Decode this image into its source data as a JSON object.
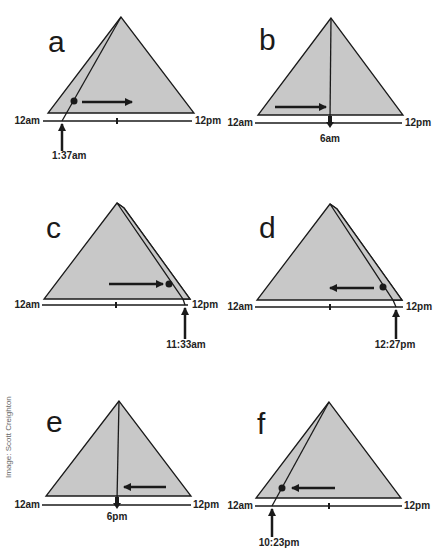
{
  "figure": {
    "credit": "Image: Scott Creighton",
    "colors": {
      "pyramid_fill": "#c8c8c8",
      "line": "#1a1a1a",
      "background": "#ffffff"
    },
    "panels": [
      {
        "letter": "a",
        "start_label": "12am",
        "end_label": "12pm",
        "time_label": "1:37am",
        "arrow_direction": "right"
      },
      {
        "letter": "b",
        "start_label": "12am",
        "end_label": "12pm",
        "time_label": "6am",
        "arrow_direction": "right"
      },
      {
        "letter": "c",
        "start_label": "12am",
        "end_label": "12pm",
        "time_label": "11:33am",
        "arrow_direction": "right"
      },
      {
        "letter": "d",
        "start_label": "12am",
        "end_label": "12pm",
        "time_label": "12:27pm",
        "arrow_direction": "left"
      },
      {
        "letter": "e",
        "start_label": "12am",
        "end_label": "12pm",
        "time_label": "6pm",
        "arrow_direction": "left"
      },
      {
        "letter": "f",
        "start_label": "12am",
        "end_label": "12pm",
        "time_label": "10:23pm",
        "arrow_direction": "left"
      }
    ]
  }
}
